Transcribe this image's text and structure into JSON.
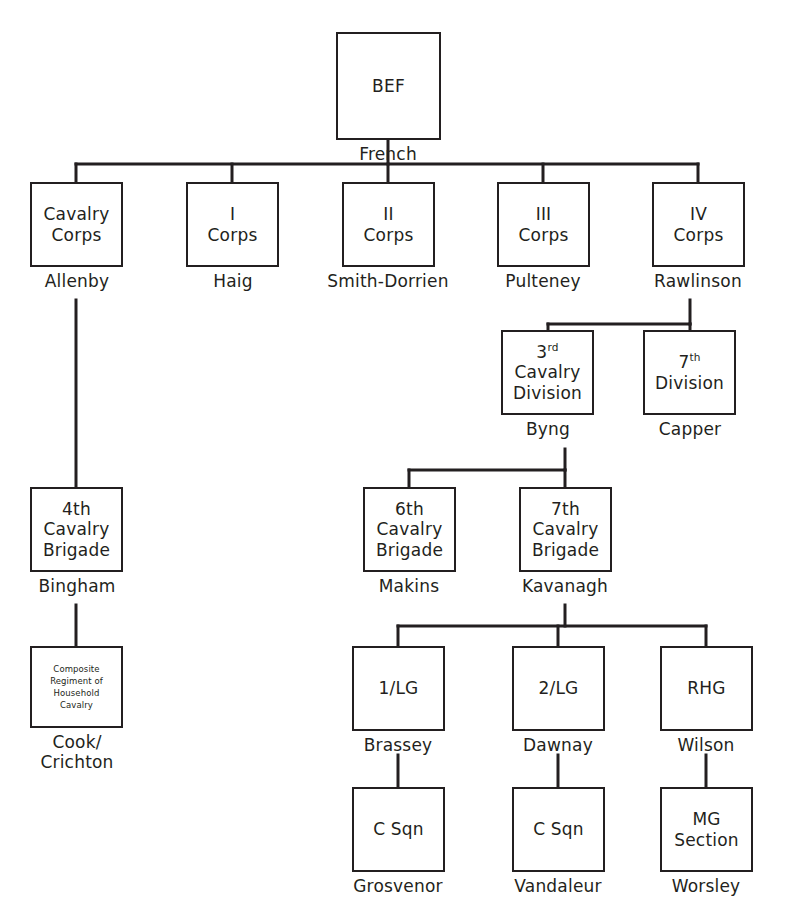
{
  "diagram": {
    "line_color": "#231f20",
    "background": "#ffffff",
    "bottom_caption": ""
  },
  "nodes": {
    "bef": {
      "line1": "BEF",
      "commander": "French"
    },
    "cavcorps": {
      "line1": "Cavalry",
      "line2": "Corps",
      "commander": "Allenby"
    },
    "icorps": {
      "line1": "I",
      "line2": "Corps",
      "commander": "Haig"
    },
    "iicorps": {
      "line1": "II",
      "line2": "Corps",
      "commander": "Smith-Dorrien"
    },
    "iiicorps": {
      "line1": "III",
      "line2": "Corps",
      "commander": "Pulteney"
    },
    "ivcorps": {
      "line1": "IV",
      "line2": "Corps",
      "commander": "Rawlinson"
    },
    "cavdiv3": {
      "num": "3",
      "sup": "rd",
      "line2": "Cavalry",
      "line3": "Division",
      "commander": "Byng"
    },
    "div7": {
      "num": "7",
      "sup": "th",
      "line2": "Division",
      "commander": "Capper"
    },
    "cavbde4": {
      "line1": "4th",
      "line2": "Cavalry",
      "line3": "Brigade",
      "commander": "Bingham"
    },
    "cavbde6": {
      "line1": "6th",
      "line2": "Cavalry",
      "line3": "Brigade",
      "commander": "Makins"
    },
    "cavbde7": {
      "line1": "7th",
      "line2": "Cavalry",
      "line3": "Brigade",
      "commander": "Kavanagh"
    },
    "composite": {
      "line1": "Composite",
      "line2": "Regiment of",
      "line3": "Household",
      "line4": "Cavalry",
      "commander": "Cook/\nCrichton"
    },
    "lg1": {
      "line1": "1/LG",
      "commander": "Brassey"
    },
    "lg2": {
      "line1": "2/LG",
      "commander": "Dawnay"
    },
    "rhg": {
      "line1": "RHG",
      "commander": "Wilson"
    },
    "csqn1": {
      "line1": "C Sqn",
      "commander": "Grosvenor"
    },
    "csqn2": {
      "line1": "C Sqn",
      "commander": "Vandaleur"
    },
    "mgsection": {
      "line1": "MG",
      "line2": "Section",
      "commander": "Worsley"
    }
  }
}
